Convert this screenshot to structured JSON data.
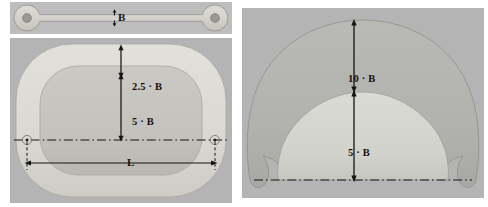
{
  "figure": {
    "kind": "engineering-dimension-drawing",
    "panel_count": 2
  },
  "colors": {
    "panel_background": "#b4b4b4",
    "band_light": "#d8d8d4",
    "core_mid": "#c3c3c0",
    "dome_mid": "#b0b0ae",
    "dome_light": "#d4d4d0",
    "line": "#1a1a1a",
    "page_background": "#ffffff"
  },
  "left_panel": {
    "strip": {
      "name": "dogbone-specimen-strip",
      "dimension_label": "B",
      "hole_count": 2
    },
    "racetrack": {
      "name": "racetrack-cross-section",
      "dimensions": [
        {
          "label": "2.5 · B",
          "position": "upper-segment"
        },
        {
          "label": "5 · B",
          "position": "lower-segment"
        },
        {
          "label": "L",
          "position": "horizontal-span"
        }
      ],
      "centerline_style": "dash-dot",
      "hole_count": 2
    }
  },
  "right_panel": {
    "dome": {
      "name": "dome-cross-section",
      "dimensions": [
        {
          "label": "10 · B",
          "position": "upper-segment"
        },
        {
          "label": "5 · B",
          "position": "lower-segment"
        }
      ],
      "centerline_style": "dash-dot"
    }
  }
}
